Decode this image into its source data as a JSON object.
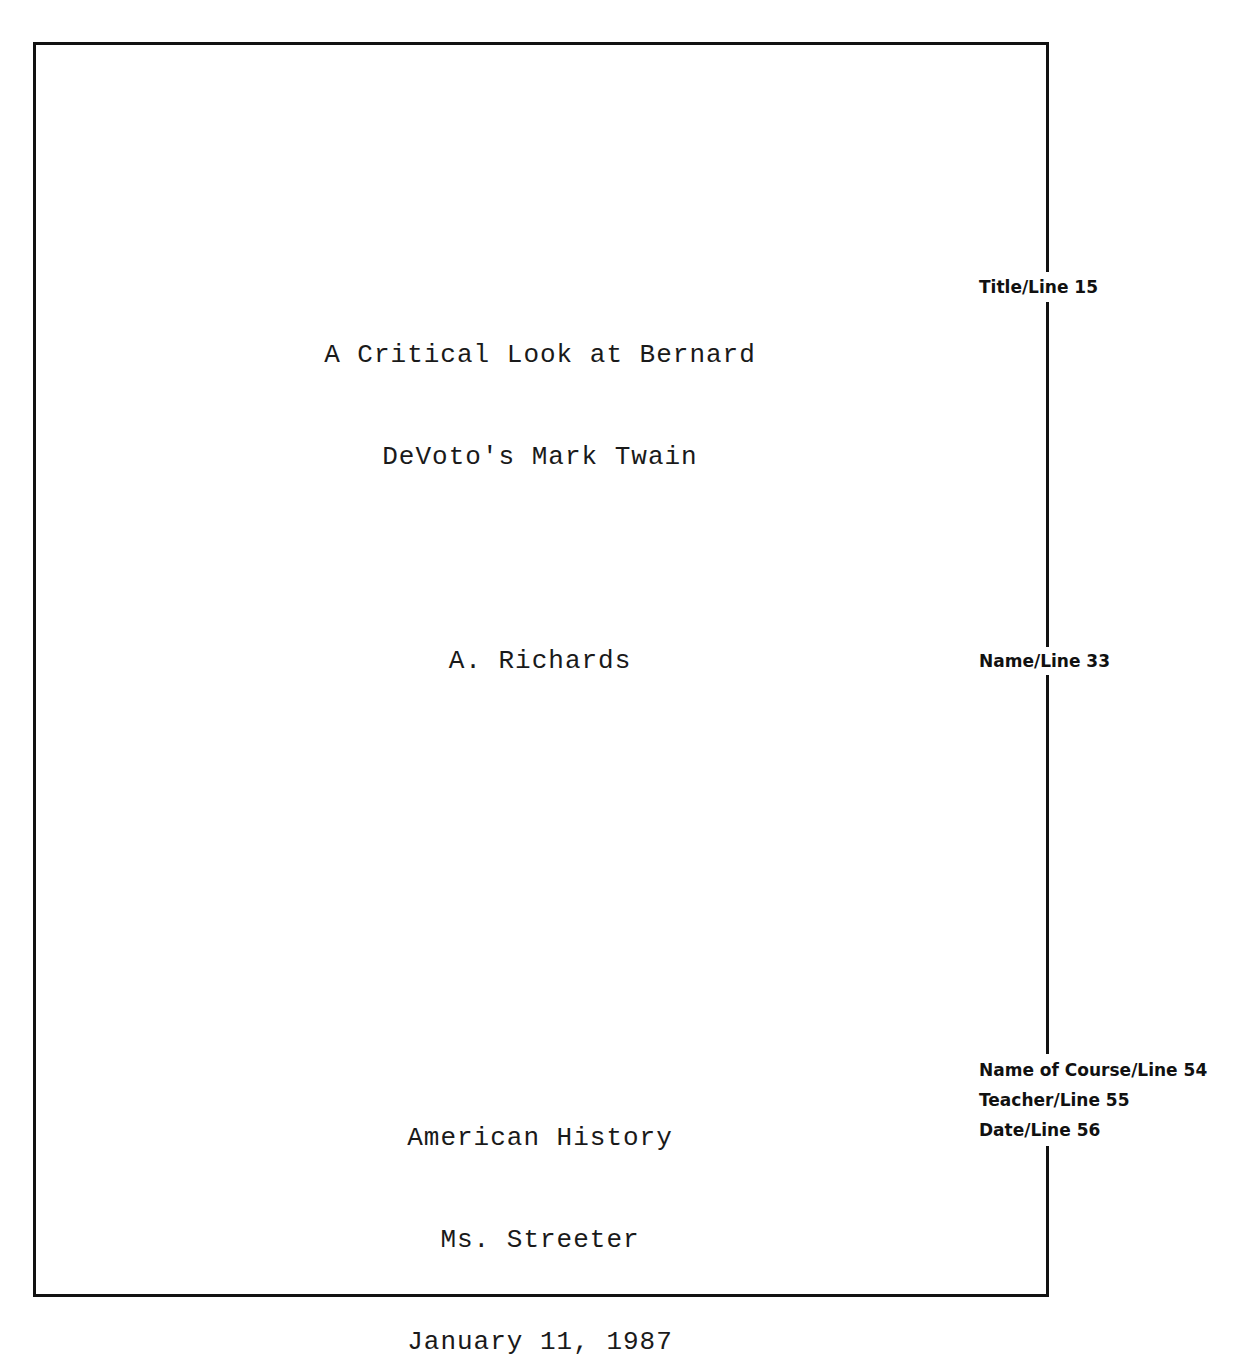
{
  "page": {
    "title_block": {
      "line1": "A Critical Look at Bernard",
      "line2": "DeVoto's Mark Twain"
    },
    "author": "A. Richards",
    "course_block": {
      "course": "American History",
      "teacher": "Ms. Streeter",
      "date": "January 11, 1987"
    }
  },
  "annotations": {
    "title": "Title/Line 15",
    "name": "Name/Line 33",
    "course": "Name of Course/Line 54",
    "teacher": "Teacher/Line 55",
    "date": "Date/Line 56"
  },
  "colors": {
    "ink": "#111111",
    "paper": "#ffffff"
  }
}
